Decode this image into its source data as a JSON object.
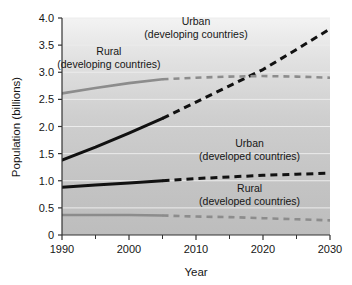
{
  "chart_data": {
    "type": "line",
    "title": "",
    "xlabel": "Year",
    "ylabel": "Population (billions)",
    "xlim": [
      1990,
      2030
    ],
    "ylim": [
      0,
      4.0
    ],
    "grid": true,
    "legend_position": "inline-annotations",
    "x_ticks": [
      1990,
      2000,
      2010,
      2020,
      2030
    ],
    "x_tick_labels": [
      "1990",
      "2000",
      "2010",
      "2020",
      "2030"
    ],
    "x_minor_ticks": [
      1995,
      2005,
      2015,
      2025
    ],
    "y_ticks": [
      0,
      0.5,
      1.0,
      1.5,
      2.0,
      2.5,
      3.0,
      3.5,
      4.0
    ],
    "y_tick_labels": [
      "0",
      "0.5",
      "1.0",
      "1.5",
      "2.0",
      "2.5",
      "3.0",
      "3.5",
      "4.0"
    ],
    "projection_start_year": 2005,
    "x": [
      1990,
      1995,
      2000,
      2005,
      2010,
      2015,
      2020,
      2025,
      2030
    ],
    "series": [
      {
        "name": "Urban (developing countries)",
        "label_line1": "Urban",
        "label_line2": "(developing countries)",
        "color": "#111111",
        "values": [
          1.38,
          1.62,
          1.88,
          2.15,
          2.45,
          2.75,
          3.05,
          3.42,
          3.8
        ],
        "style_historical": "solid",
        "style_projection": "dashed"
      },
      {
        "name": "Rural (developing countries)",
        "label_line1": "Rural",
        "label_line2": "(developing countries)",
        "color": "#8c8c8c",
        "values": [
          2.61,
          2.71,
          2.8,
          2.87,
          2.9,
          2.92,
          2.93,
          2.92,
          2.9
        ],
        "style_historical": "solid",
        "style_projection": "dashed"
      },
      {
        "name": "Urban (developed countries)",
        "label_line1": "Urban",
        "label_line2": "(developed countries)",
        "color": "#111111",
        "values": [
          0.88,
          0.92,
          0.96,
          1.0,
          1.04,
          1.07,
          1.1,
          1.12,
          1.14
        ],
        "style_historical": "solid",
        "style_projection": "dashed"
      },
      {
        "name": "Rural (developed countries)",
        "label_line1": "Rural",
        "label_line2": "(developed countries)",
        "color": "#8c8c8c",
        "values": [
          0.37,
          0.37,
          0.37,
          0.36,
          0.34,
          0.33,
          0.31,
          0.29,
          0.27
        ],
        "style_historical": "solid",
        "style_projection": "dashed"
      }
    ],
    "annotations": [
      {
        "text_line1": "Urban",
        "text_line2": "(developing countries)",
        "x": 2010,
        "y": 3.88
      },
      {
        "text_line1": "Rural",
        "text_line2": "(developing countries)",
        "x": 1997,
        "y": 3.32
      },
      {
        "text_line1": "Urban",
        "text_line2": "(developed countries)",
        "x": 2018,
        "y": 1.62
      },
      {
        "text_line1": "Rural",
        "text_line2": "(developed countries)",
        "x": 2018,
        "y": 0.8
      }
    ],
    "plot_background": {
      "top_color": "#f2f2f2",
      "bottom_color": "#c2c2c2"
    }
  }
}
